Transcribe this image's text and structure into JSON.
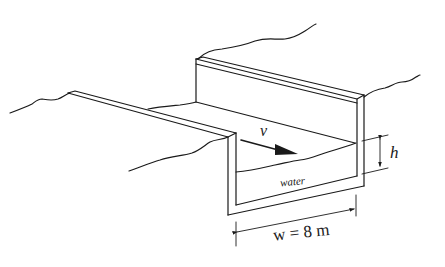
{
  "figure": {
    "labels": {
      "velocity": "v",
      "depth": "h",
      "fluid": "water",
      "width": "w = 8 m"
    },
    "quantities": {
      "channel_width": {
        "symbol": "w",
        "value": 8,
        "unit": "m"
      },
      "water_depth": {
        "symbol": "h"
      },
      "flow_velocity": {
        "symbol": "v"
      }
    },
    "colors": {
      "line": "#1a1a1a",
      "background": "#ffffff"
    }
  }
}
